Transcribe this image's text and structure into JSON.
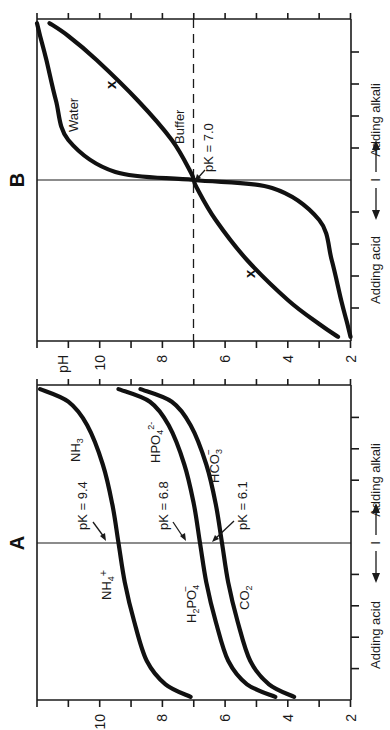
{
  "figure": {
    "orientation": "rotated 90° counter-clockwise",
    "panels": [
      {
        "id": "A",
        "label": "A",
        "ylabel": "pH",
        "xlabel_left": "Adding acid",
        "xlabel_right": "Adding alkali",
        "midpoint_marker": "I",
        "ph_ticks": [
          "10",
          "8",
          "6",
          "4",
          "2"
        ],
        "curves": [
          {
            "name": "NH4+/NH3",
            "acid_label": "NH4+",
            "base_label": "NH3",
            "pk_label": "pK = 9.4",
            "pk": 9.4
          },
          {
            "name": "H2PO4-/HPO42-",
            "acid_label": "H2PO4−",
            "base_label": "HPO42−",
            "pk_label": "pK = 6.8",
            "pk": 6.8
          },
          {
            "name": "CO2/HCO3-",
            "acid_label": "CO2",
            "base_label": "HCO3−",
            "pk_label": "pK = 6.1",
            "pk": 6.1
          }
        ]
      },
      {
        "id": "B",
        "label": "B",
        "ylabel": "pH",
        "xlabel_left": "Adding acid",
        "xlabel_right": "Adding alkali",
        "midpoint_marker": "I",
        "ph_ticks": [
          "pH",
          "10",
          "8",
          "6",
          "4",
          "2"
        ],
        "curves": [
          {
            "name": "Water",
            "label": "Water"
          },
          {
            "name": "Buffer",
            "label": "Buffer",
            "pk_label": "pK = 7.0",
            "pk": 7.0
          }
        ],
        "markers": [
          "x",
          "x"
        ],
        "reference_line": "pH 7 (dashed)"
      }
    ]
  },
  "labels": {
    "panel_a": "A",
    "panel_b": "B",
    "ph": "pH",
    "adding_acid": "Adding acid",
    "adding_alkali": "Adding alkali",
    "mid_marker": "I",
    "water": "Water",
    "buffer": "Buffer",
    "x_marker": "x",
    "pk_70": "pK = 7.0",
    "pk_94": "pK = 9.4",
    "pk_68": "pK = 6.8",
    "pk_61": "pK = 6.1",
    "nh4": "NH",
    "nh3": "NH",
    "h2po4": "H",
    "hpo4": "HPO",
    "hco3": "HCO",
    "co2": "CO",
    "tick_10": "10",
    "tick_8": "8",
    "tick_6": "6",
    "tick_4": "4",
    "tick_2": "2"
  },
  "chart_data": [
    {
      "type": "line",
      "title": "A",
      "xlabel": "Adding acid ← | → Adding alkali",
      "ylabel": "pH",
      "ylim": [
        2,
        12
      ],
      "xlim": [
        -1,
        1
      ],
      "x_ticks": [
        -1,
        -0.8,
        -0.6,
        -0.4,
        -0.2,
        0,
        0.2,
        0.4,
        0.6,
        0.8,
        1
      ],
      "y_ticks": [
        2,
        4,
        6,
        8,
        10
      ],
      "grid": false,
      "x": [
        -0.98,
        -0.9,
        -0.75,
        -0.5,
        -0.25,
        0,
        0.25,
        0.5,
        0.75,
        0.9,
        0.98
      ],
      "series": [
        {
          "name": "NH4+ / NH3 (pK = 9.4)",
          "values": [
            7.1,
            7.9,
            8.5,
            8.9,
            9.2,
            9.4,
            9.6,
            9.9,
            10.4,
            11.0,
            11.9
          ]
        },
        {
          "name": "H2PO4− / HPO42− (pK = 6.8)",
          "values": [
            4.4,
            5.3,
            5.9,
            6.3,
            6.6,
            6.8,
            7.0,
            7.3,
            7.8,
            8.4,
            9.4
          ]
        },
        {
          "name": "CO2 / HCO3− (pK = 6.1)",
          "values": [
            3.8,
            4.6,
            5.2,
            5.6,
            5.9,
            6.1,
            6.3,
            6.6,
            7.1,
            7.7,
            8.7
          ]
        }
      ],
      "annotations": [
        "pK = 9.4",
        "pK = 6.8",
        "pK = 6.1",
        "NH4+",
        "NH3",
        "H2PO4−",
        "HPO42−",
        "CO2",
        "HCO3−"
      ]
    },
    {
      "type": "line",
      "title": "B",
      "xlabel": "Adding acid ← | → Adding alkali",
      "ylabel": "pH",
      "ylim": [
        2,
        12
      ],
      "xlim": [
        -1,
        1
      ],
      "x_ticks": [
        -1,
        -0.8,
        -0.6,
        -0.4,
        -0.2,
        0,
        0.2,
        0.4,
        0.6,
        0.8,
        1
      ],
      "y_ticks": [
        2,
        4,
        6,
        8,
        10
      ],
      "grid": false,
      "reference_lines": [
        {
          "axis": "y",
          "value": 7,
          "style": "dashed"
        }
      ],
      "x": [
        -0.98,
        -0.9,
        -0.75,
        -0.5,
        -0.25,
        -0.05,
        0,
        0.05,
        0.25,
        0.5,
        0.75,
        0.9,
        0.98
      ],
      "series": [
        {
          "name": "Water",
          "values": [
            2.0,
            2.1,
            2.3,
            2.6,
            3.0,
            4.5,
            7.0,
            9.5,
            11.0,
            11.4,
            11.7,
            11.9,
            12.0
          ]
        },
        {
          "name": "Buffer (pK = 7.0)",
          "values": [
            2.4,
            3.0,
            4.0,
            5.3,
            6.3,
            6.9,
            7.0,
            7.1,
            7.7,
            8.8,
            10.1,
            11.0,
            11.6
          ]
        }
      ],
      "annotations": [
        "Water",
        "Buffer",
        "pK = 7.0",
        "x",
        "x"
      ]
    }
  ]
}
